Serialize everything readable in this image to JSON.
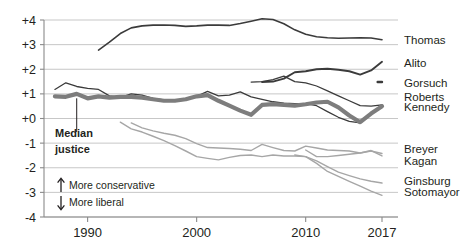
{
  "chart_data": {
    "type": "line",
    "title": "",
    "subtitle": "",
    "xlabel": "",
    "ylabel": "",
    "xlim": [
      1986,
      2017
    ],
    "ylim": [
      -4,
      4
    ],
    "grid": true,
    "legend_position": "right-inline",
    "x_ticks": [
      "1990",
      "2000",
      "2010",
      "2017"
    ],
    "x_tick_values": [
      1990,
      2000,
      2010,
      2017
    ],
    "y_ticks": [
      "+4",
      "+3",
      "+2",
      "+1",
      "+0",
      "-1",
      "-2",
      "-3",
      "-4"
    ],
    "y_tick_values": [
      4,
      3,
      2,
      1,
      0,
      -1,
      -2,
      -3,
      -4
    ],
    "annotations": [
      {
        "name": "median-justice",
        "text_line1": "Median",
        "text_line2": "justice",
        "points_to_year": 1989
      },
      {
        "name": "more-conservative",
        "text": "More conservative",
        "arrow": "up"
      },
      {
        "name": "more-liberal",
        "text": "More liberal",
        "arrow": "down"
      }
    ],
    "series": [
      {
        "name": "Thomas",
        "color": "#3b3b3b",
        "width": 1.6,
        "x": [
          1991,
          1992,
          1993,
          1994,
          1995,
          1996,
          1997,
          1998,
          1999,
          2000,
          2001,
          2002,
          2003,
          2004,
          2005,
          2006,
          2007,
          2008,
          2009,
          2010,
          2011,
          2012,
          2013,
          2014,
          2015,
          2016,
          2017
        ],
        "values": [
          2.78,
          3.1,
          3.45,
          3.68,
          3.76,
          3.79,
          3.8,
          3.78,
          3.74,
          3.76,
          3.79,
          3.79,
          3.78,
          3.86,
          3.95,
          4.05,
          4.02,
          3.85,
          3.6,
          3.42,
          3.32,
          3.28,
          3.26,
          3.27,
          3.28,
          3.27,
          3.2
        ]
      },
      {
        "name": "Alito",
        "color": "#3b3b3b",
        "width": 1.9,
        "x": [
          2006,
          2007,
          2008,
          2009,
          2010,
          2011,
          2012,
          2013,
          2014,
          2015,
          2016,
          2017
        ],
        "values": [
          1.48,
          1.5,
          1.62,
          1.88,
          1.92,
          2.0,
          2.02,
          1.98,
          1.92,
          1.78,
          1.95,
          2.3
        ]
      },
      {
        "name": "Gorsuch",
        "color": "#3b3b3b",
        "width": 2.4,
        "x": [
          2016.6,
          2017
        ],
        "values": [
          1.48,
          1.48
        ]
      },
      {
        "name": "Roberts",
        "color": "#3b3b3b",
        "width": 1.3,
        "x": [
          2005,
          2006,
          2007,
          2008,
          2009,
          2010,
          2011,
          2012,
          2013,
          2014,
          2015,
          2016,
          2017
        ],
        "values": [
          1.48,
          1.5,
          1.58,
          1.72,
          1.5,
          1.45,
          1.32,
          1.12,
          0.92,
          0.72,
          0.52,
          0.5,
          0.55
        ]
      },
      {
        "name": "Kennedy",
        "color": "#3b3b3b",
        "width": 1.3,
        "x": [
          1987,
          1988,
          1989,
          1990,
          1991,
          1992,
          1993,
          1994,
          1995,
          1996,
          1997,
          1998,
          1999,
          2000,
          2001,
          2002,
          2003,
          2004,
          2005,
          2006,
          2007,
          2008,
          2009,
          2010,
          2011,
          2012,
          2013,
          2014,
          2015,
          2016,
          2017
        ],
        "values": [
          1.18,
          1.45,
          1.3,
          1.22,
          1.18,
          0.92,
          0.86,
          1.0,
          0.95,
          0.82,
          0.76,
          0.72,
          0.78,
          0.9,
          1.1,
          0.92,
          0.95,
          1.08,
          0.88,
          0.78,
          0.68,
          0.62,
          0.6,
          0.6,
          0.52,
          0.28,
          0.05,
          -0.12,
          -0.18,
          0.2,
          0.52
        ]
      },
      {
        "name": "Median justice",
        "color": "#7d7d7d",
        "width": 4.2,
        "x": [
          1987,
          1988,
          1989,
          1990,
          1991,
          1992,
          1993,
          1994,
          1995,
          1996,
          1997,
          1998,
          1999,
          2000,
          2001,
          2002,
          2003,
          2004,
          2005,
          2006,
          2007,
          2008,
          2009,
          2010,
          2011,
          2012,
          2013,
          2014,
          2015,
          2016,
          2017
        ],
        "values": [
          0.9,
          0.88,
          1.0,
          0.82,
          0.9,
          0.85,
          0.88,
          0.88,
          0.85,
          0.78,
          0.72,
          0.72,
          0.78,
          0.9,
          0.95,
          0.72,
          0.52,
          0.32,
          0.15,
          0.55,
          0.58,
          0.55,
          0.52,
          0.58,
          0.65,
          0.68,
          0.45,
          0.12,
          -0.15,
          0.2,
          0.5
        ]
      },
      {
        "name": "Breyer",
        "color": "#a6a6a6",
        "width": 1.4,
        "x": [
          1994,
          1995,
          1996,
          1997,
          1998,
          1999,
          2000,
          2001,
          2002,
          2003,
          2004,
          2005,
          2006,
          2007,
          2008,
          2009,
          2010,
          2011,
          2012,
          2013,
          2014,
          2015,
          2016,
          2017
        ],
        "values": [
          -0.18,
          -0.38,
          -0.5,
          -0.6,
          -0.68,
          -0.82,
          -1.02,
          -1.18,
          -1.2,
          -1.22,
          -1.25,
          -1.3,
          -1.05,
          -1.18,
          -1.3,
          -1.32,
          -1.12,
          -1.2,
          -1.28,
          -1.3,
          -1.32,
          -1.4,
          -1.32,
          -1.42
        ]
      },
      {
        "name": "Kagan",
        "color": "#a6a6a6",
        "width": 1.4,
        "x": [
          2010,
          2011,
          2012,
          2013,
          2014,
          2015,
          2016,
          2017
        ],
        "values": [
          -1.28,
          -1.55,
          -1.55,
          -1.5,
          -1.45,
          -1.4,
          -1.3,
          -1.52
        ]
      },
      {
        "name": "Ginsburg",
        "color": "#a6a6a6",
        "width": 1.4,
        "x": [
          1993,
          1994,
          1995,
          1996,
          1997,
          1998,
          1999,
          2000,
          2001,
          2002,
          2003,
          2004,
          2005,
          2006,
          2007,
          2008,
          2009,
          2010,
          2011,
          2012,
          2013,
          2014,
          2015,
          2016,
          2017
        ],
        "values": [
          -0.15,
          -0.42,
          -0.55,
          -0.72,
          -0.9,
          -1.1,
          -1.32,
          -1.55,
          -1.62,
          -1.68,
          -1.58,
          -1.5,
          -1.48,
          -1.55,
          -1.48,
          -1.52,
          -1.52,
          -1.55,
          -1.72,
          -1.95,
          -2.18,
          -2.32,
          -2.45,
          -2.55,
          -2.62
        ]
      },
      {
        "name": "Sotomayor",
        "color": "#a6a6a6",
        "width": 1.4,
        "x": [
          2009,
          2010,
          2011,
          2012,
          2013,
          2014,
          2015,
          2016,
          2017
        ],
        "values": [
          -1.48,
          -1.55,
          -1.82,
          -2.15,
          -2.35,
          -2.55,
          -2.75,
          -2.95,
          -3.12
        ]
      }
    ],
    "series_labels": [
      {
        "name": "Thomas",
        "y_value": 3.2
      },
      {
        "name": "Alito",
        "y_value": 2.26
      },
      {
        "name": "Gorsuch",
        "y_value": 1.45
      },
      {
        "name": "Roberts",
        "y_value": 0.86
      },
      {
        "name": "Kennedy",
        "y_value": 0.46
      },
      {
        "name": "Breyer",
        "y_value": -1.25
      },
      {
        "name": "Kagan",
        "y_value": -1.72
      },
      {
        "name": "Ginsburg",
        "y_value": -2.52
      },
      {
        "name": "Sotomayor",
        "y_value": -2.98
      }
    ]
  }
}
